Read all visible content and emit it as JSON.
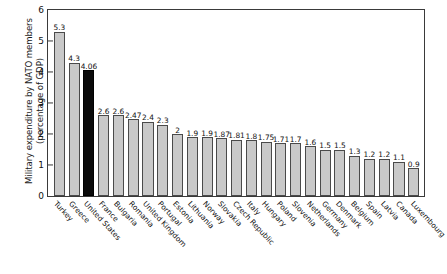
{
  "chart_data": {
    "type": "bar",
    "title": "",
    "xlabel": "",
    "ylabel": "Military expenditure by NATO members\n(percentage of GDP)",
    "ylim": [
      0,
      6
    ],
    "yticks": [
      0,
      1,
      2,
      3,
      4,
      5,
      6
    ],
    "grid": false,
    "legend": "none",
    "highlight_category": "United States",
    "highlight_color": "#0a0a0a",
    "bar_color": "#c9c9c9",
    "bar_border_color": "#4a4a4a",
    "categories": [
      "Turkey",
      "Greece",
      "United States",
      "France",
      "Bulgaria",
      "Romania",
      "United Kingdom",
      "Portugal",
      "Estonia",
      "Lithuania",
      "Norway",
      "Slovakia",
      "Czech Republic",
      "Italy",
      "Hungary",
      "Poland",
      "Slovenia",
      "Netherlands",
      "Germany",
      "Denmark",
      "Belgium",
      "Spain",
      "Latvia",
      "Canada",
      "Luxembourg"
    ],
    "values": [
      5.3,
      4.3,
      4.06,
      2.6,
      2.6,
      2.47,
      2.4,
      2.3,
      2,
      1.9,
      1.9,
      1.87,
      1.81,
      1.8,
      1.75,
      1.71,
      1.7,
      1.6,
      1.5,
      1.5,
      1.3,
      1.2,
      1.2,
      1.1,
      0.9
    ],
    "value_labels": [
      "5.3",
      "4.3",
      "4.06",
      "2.6",
      "2.6",
      "2.47",
      "2.4",
      "2.3",
      "2",
      "1.9",
      "1.9",
      "1.87",
      "1.81",
      "1.8",
      "1.75",
      "1.71",
      "1.7",
      "1.6",
      "1.5",
      "1.5",
      "1.3",
      "1.2",
      "1.2",
      "1.1",
      "0.9"
    ]
  },
  "axis": {
    "y_title": "Military expenditure by NATO members\n(percentage of GDP)",
    "tick_labels": [
      "6",
      "5",
      "4",
      "3",
      "2",
      "1",
      "0"
    ]
  },
  "source": {
    "text": ""
  }
}
